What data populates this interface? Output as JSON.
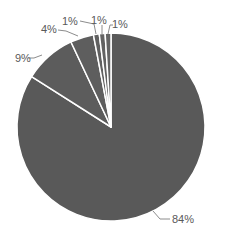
{
  "chart_data": {
    "type": "pie",
    "title": "",
    "start_angle_deg": 0,
    "direction": "clockwise",
    "slices": [
      {
        "label": "84%",
        "value": 84,
        "color": "#595959"
      },
      {
        "label": "9%",
        "value": 9,
        "color": "#5c5c5c"
      },
      {
        "label": "4%",
        "value": 4,
        "color": "#5e5e5e"
      },
      {
        "label": "1%",
        "value": 1,
        "color": "#606060"
      },
      {
        "label": "1%",
        "value": 1,
        "color": "#626262"
      },
      {
        "label": "1%",
        "value": 1,
        "color": "#646464"
      }
    ],
    "values": [
      84,
      9,
      4,
      1,
      1,
      1
    ],
    "data_labels": [
      "84%",
      "9%",
      "4%",
      "1%",
      "1%",
      "1%"
    ],
    "legend": "none",
    "separator_color": "#ffffff",
    "center": [
      111,
      127
    ],
    "radius": 94
  }
}
